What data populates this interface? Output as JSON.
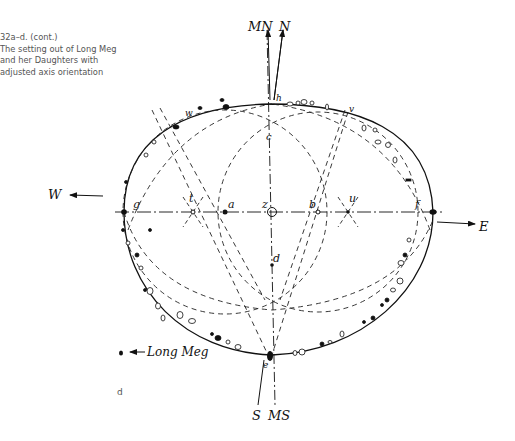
{
  "caption": {
    "figure_number": "32a–d. (cont.)",
    "lines": [
      "The setting out of Long Meg",
      "and her Daughters with",
      "adjusted axis orientation"
    ]
  },
  "subfigure_label": "d",
  "compass": {
    "magnetic_north": "MN",
    "true_north": "N",
    "west": "W",
    "east": "E",
    "true_south": "S",
    "magnetic_south": "MS"
  },
  "points": {
    "a": "a",
    "b": "b",
    "c": "c",
    "d": "d",
    "e": "e",
    "f": "f",
    "g": "g",
    "h": "h",
    "t": "t",
    "u": "u",
    "v": "v",
    "w": "w",
    "z": "z"
  },
  "outlier_label": "Long Meg",
  "colors": {
    "ink": "#111111",
    "caption": "#555555",
    "background": "#ffffff"
  }
}
